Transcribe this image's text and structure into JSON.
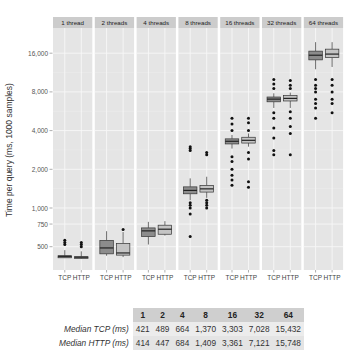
{
  "chart_data": {
    "type": "boxplot",
    "title": "",
    "ylabel": "Time per query (ms, 1000 samples)",
    "xlabel": "",
    "yscale": "log",
    "ylim": [
      380,
      21000
    ],
    "yticks": [
      500,
      750,
      1000,
      2000,
      4000,
      8000,
      16000
    ],
    "ytick_labels": [
      "500",
      "750",
      "1,000",
      "2,000",
      "4,000",
      "8,000",
      "16,000"
    ],
    "grid": true,
    "facets": [
      "1 thread",
      "2 threads",
      "4 threads",
      "8 threads",
      "16 threads",
      "32 threads",
      "64 threads"
    ],
    "categories": [
      "TCP",
      "HTTP"
    ],
    "colors": {
      "TCP": "#8c8c8c",
      "HTTP": "#c4c4c4",
      "panel": "#e5e5e5",
      "strip": "#cccccc",
      "grid": "#f5f5f5"
    },
    "series": [
      {
        "facet": "1 thread",
        "name": "TCP",
        "median": 421,
        "q1": 410,
        "q3": 425,
        "whisker_low": 408,
        "whisker_high": 470,
        "outliers": [
          520,
          540,
          560
        ]
      },
      {
        "facet": "1 thread",
        "name": "HTTP",
        "median": 414,
        "q1": 405,
        "q3": 418,
        "whisker_low": 402,
        "whisker_high": 460,
        "outliers": [
          500,
          520,
          540
        ]
      },
      {
        "facet": "2 threads",
        "name": "TCP",
        "median": 489,
        "q1": 440,
        "q3": 560,
        "whisker_low": 425,
        "whisker_high": 660,
        "outliers": []
      },
      {
        "facet": "2 threads",
        "name": "HTTP",
        "median": 447,
        "q1": 430,
        "q3": 530,
        "whisker_low": 415,
        "whisker_high": 650,
        "outliers": [
          680
        ]
      },
      {
        "facet": "4 threads",
        "name": "TCP",
        "median": 664,
        "q1": 600,
        "q3": 700,
        "whisker_low": 520,
        "whisker_high": 780,
        "outliers": []
      },
      {
        "facet": "4 threads",
        "name": "HTTP",
        "median": 684,
        "q1": 625,
        "q3": 735,
        "whisker_low": 610,
        "whisker_high": 790,
        "outliers": []
      },
      {
        "facet": "8 threads",
        "name": "TCP",
        "median": 1370,
        "q1": 1290,
        "q3": 1460,
        "whisker_low": 1150,
        "whisker_high": 1700,
        "outliers": [
          600,
          900,
          1000,
          1050,
          1100,
          2800,
          2900,
          3000
        ]
      },
      {
        "facet": "8 threads",
        "name": "HTTP",
        "median": 1409,
        "q1": 1330,
        "q3": 1500,
        "whisker_low": 1200,
        "whisker_high": 1750,
        "outliers": [
          1000,
          1050,
          1100,
          1150,
          2600,
          2700
        ]
      },
      {
        "facet": "16 threads",
        "name": "TCP",
        "median": 3303,
        "q1": 3150,
        "q3": 3450,
        "whisker_low": 2900,
        "whisker_high": 3700,
        "outliers": [
          1500,
          1650,
          1800,
          2000,
          2300,
          2500,
          4000,
          4500,
          5000
        ]
      },
      {
        "facet": "16 threads",
        "name": "HTTP",
        "median": 3361,
        "q1": 3200,
        "q3": 3550,
        "whisker_low": 3000,
        "whisker_high": 3800,
        "outliers": [
          1450,
          1600,
          2400,
          2700,
          4000,
          4600,
          5000
        ]
      },
      {
        "facet": "32 threads",
        "name": "TCP",
        "median": 7028,
        "q1": 6700,
        "q3": 7300,
        "whisker_low": 6000,
        "whisker_high": 7800,
        "outliers": [
          2600,
          2800,
          3500,
          4200,
          5000,
          5500,
          8500,
          9200,
          10000
        ]
      },
      {
        "facet": "32 threads",
        "name": "HTTP",
        "median": 7121,
        "q1": 6800,
        "q3": 7500,
        "whisker_low": 6000,
        "whisker_high": 7900,
        "outliers": [
          2600,
          3800,
          4300,
          5000,
          5600,
          8500,
          9000,
          9800
        ]
      },
      {
        "facet": "64 threads",
        "name": "TCP",
        "median": 15432,
        "q1": 14200,
        "q3": 16600,
        "whisker_low": 12000,
        "whisker_high": 19500,
        "outliers": [
          5000,
          6000,
          6500,
          7000,
          8000,
          8500,
          9000,
          10000
        ]
      },
      {
        "facet": "64 threads",
        "name": "HTTP",
        "median": 15748,
        "q1": 14800,
        "q3": 17200,
        "whisker_low": 12500,
        "whisker_high": 19500,
        "outliers": [
          5500,
          6500,
          7000,
          8000,
          9000,
          10000
        ]
      }
    ]
  },
  "table": {
    "headers": [
      "1",
      "2",
      "4",
      "8",
      "16",
      "32",
      "64"
    ],
    "rows": [
      {
        "label": "Median TCP (ms)",
        "values": [
          "421",
          "489",
          "664",
          "1,370",
          "3,303",
          "7,028",
          "15,432"
        ]
      },
      {
        "label": "Median HTTP (ms)",
        "values": [
          "414",
          "447",
          "684",
          "1,409",
          "3,361",
          "7,121",
          "15,748"
        ]
      }
    ]
  }
}
